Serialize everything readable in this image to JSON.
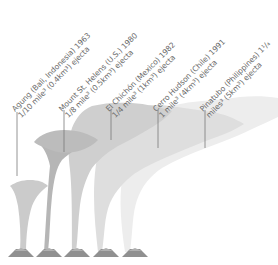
{
  "figure": {
    "type": "volcanic-eruption-plume-comparison",
    "colors": {
      "agung_plume": "#c9c9c9",
      "st_helens_plume": "#b3b3b3",
      "el_chichon_plume": "#cdcdcd",
      "cerro_hudson_plume": "#dcdcdc",
      "pinatubo_plume": "#ececec",
      "leader_line": "#7a7a7a",
      "label_text": "#6a6a6a",
      "volcano_cone": "#8e8e8e"
    },
    "eruptions": [
      {
        "name": "Agung (Bali, Indonesia) 1963",
        "volume_line_prefix": "1/10 mile",
        "volume_line_suffix": " (0.4km",
        "volume_line_end": ") ejecta",
        "volume_text": "1/10 mile³ (0.4km³) ejecta"
      },
      {
        "name": "Mount St. Helens (U.S.) 1980",
        "volume_line_prefix": "1/8 mile",
        "volume_line_suffix": " (0.5km",
        "volume_line_end": ") ejecta",
        "volume_text": "1/8 mile³ (0.5km³) ejecta"
      },
      {
        "name": "El Chichón (Mexico) 1982",
        "volume_line_prefix": "1/4 mile",
        "volume_line_suffix": " (1km",
        "volume_line_end": ") ejecta",
        "volume_text": "1/4 mile³ (1km³) ejecta"
      },
      {
        "name": "Cerro Hudson (Chile) 1991",
        "volume_line_prefix": "1 mile",
        "volume_line_suffix": " (4km",
        "volume_line_end": ") ejecta",
        "volume_text": "1 mile³ (4km³) ejecta"
      },
      {
        "name": "Pinatubo (Philippines) 1¹/₄",
        "volume_line_prefix": "miles",
        "volume_line_suffix": " (5km",
        "volume_line_end": ") ejecta",
        "volume_text": "miles³ (5km³) ejecta"
      }
    ],
    "sup_three": "3"
  }
}
